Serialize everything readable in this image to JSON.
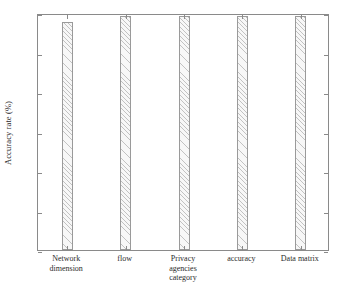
{
  "chart_data": {
    "type": "bar",
    "title": "",
    "xlabel": "category",
    "ylabel": "Accuracy rate (%)",
    "categories": [
      "Network dimension",
      "flow",
      "Privacy agencies",
      "accuracy",
      "Data matrix"
    ],
    "values": [
      98.8,
      99.6,
      99.6,
      99.6,
      99.6
    ],
    "ylim": [
      70,
      100
    ],
    "yticks": [
      70,
      75,
      80,
      85,
      90,
      95,
      100
    ],
    "ytick_labels": [
      "70",
      "75",
      "80",
      "85",
      "90",
      "95",
      "100"
    ],
    "grid": false,
    "legend": null,
    "bar_facecolor": "#f7f7f7",
    "bar_edgecolor": "#9a9a9a",
    "bar_hatch": "diagonal",
    "axis_color": "#8a8a8a"
  },
  "axis": {
    "y_title": "Accuracy rate (%)",
    "x_title": "category"
  },
  "category_labels": [
    {
      "line1": "Network",
      "line2": "dimension"
    },
    {
      "line1": "flow",
      "line2": ""
    },
    {
      "line1": "Privacy",
      "line2": "agencies"
    },
    {
      "line1": "accuracy",
      "line2": ""
    },
    {
      "line1": "Data matrix",
      "line2": ""
    }
  ]
}
